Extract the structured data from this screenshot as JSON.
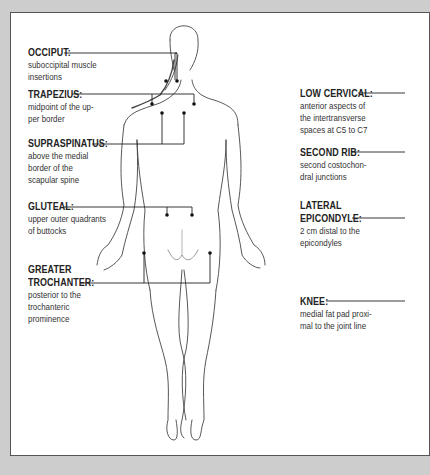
{
  "diagram": {
    "left_labels": [
      {
        "id": "occiput",
        "title": "OCCIPUT:",
        "desc": "suboccipital muscle\ninsertions"
      },
      {
        "id": "trapezius",
        "title": "TRAPEZIUS:",
        "desc": "midpoint of the up-\nper border"
      },
      {
        "id": "supraspinatus",
        "title": "SUPRASPINATUS:",
        "desc": "above the medial\nborder of the\nscapular spine"
      },
      {
        "id": "gluteal",
        "title": "GLUTEAL:",
        "desc": "upper outer quadrants\nof buttocks"
      },
      {
        "id": "greater-trochanter",
        "title_line1": "GREATER",
        "title": "TROCHANTER:",
        "desc": "posterior to the\ntrochanteric\nprominence"
      }
    ],
    "right_labels": [
      {
        "id": "low-cervical",
        "title": "LOW CERVICAL:",
        "desc": "anterior aspects of\nthe intertransverse\nspaces at C5 to C7"
      },
      {
        "id": "second-rib",
        "title": "SECOND RIB:",
        "desc": "second costochon-\ndral junctions"
      },
      {
        "id": "lateral-epicondyle",
        "title_line1": "LATERAL",
        "title": "EPICONDYLE:",
        "desc": "2 cm distal to the\nepicondyles"
      },
      {
        "id": "knee",
        "title": "KNEE:",
        "desc": "medial fat pad proxi-\nmal to the joint line"
      }
    ],
    "colors": {
      "frame_bg": "#cdcdcd",
      "panel": "#ffffff",
      "line": "#222222"
    }
  }
}
